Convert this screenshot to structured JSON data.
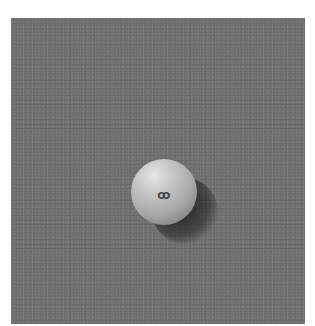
{
  "image": {
    "description": "Grayscale photograph of a small sphere with an embossed symbol resting on a textured gray surface, casting a shadow to the lower right",
    "subject": "sphere",
    "mark_on_sphere": "ꝏ",
    "colors": {
      "surface": "#6e6e6e",
      "sphere_highlight": "#e6e6e6",
      "sphere_mid": "#a8a8a8",
      "shadow": "#1e1e1e",
      "border": "#ffffff"
    }
  }
}
